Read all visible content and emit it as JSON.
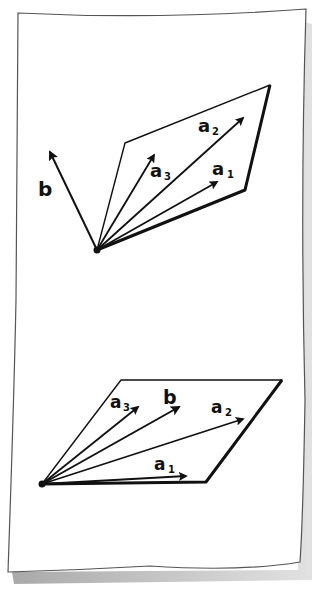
{
  "colors": {
    "ink": "#111111",
    "paper": "#ffffff",
    "paper_edge": "#555555",
    "shadow": "#b8b8b8"
  },
  "figure": {
    "top_panel": {
      "description": "vector b out of the plane spanned by a1, a2, a3",
      "labels": {
        "b": "b",
        "a1_base": "a",
        "a1_sub": "1",
        "a2_base": "a",
        "a2_sub": "2",
        "a3_base": "a",
        "a3_sub": "3"
      }
    },
    "bottom_panel": {
      "description": "vector b lying in the plane spanned by a1, a2, a3",
      "labels": {
        "b": "b",
        "a1_base": "a",
        "a1_sub": "1",
        "a2_base": "a",
        "a2_sub": "2",
        "a3_base": "a",
        "a3_sub": "3"
      }
    }
  }
}
